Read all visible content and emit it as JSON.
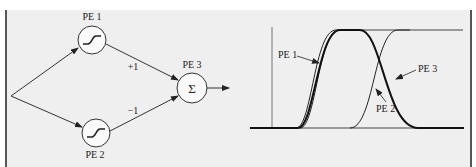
{
  "diagram": {
    "nodes": [
      {
        "id": "pe1",
        "label": "PE 1",
        "symbol": "sigmoid"
      },
      {
        "id": "pe2",
        "label": "PE 2",
        "symbol": "sigmoid"
      },
      {
        "id": "pe3",
        "label": "PE 3",
        "symbol": "Σ"
      }
    ],
    "weights": {
      "pe1_to_pe3": "+1",
      "pe2_to_pe3": "−1"
    }
  },
  "plot": {
    "labels": {
      "pe1": "PE 1",
      "pe2": "PE 2",
      "pe3": "PE 3"
    }
  },
  "colors": {
    "background": "#efefef",
    "stroke": "#222222"
  }
}
